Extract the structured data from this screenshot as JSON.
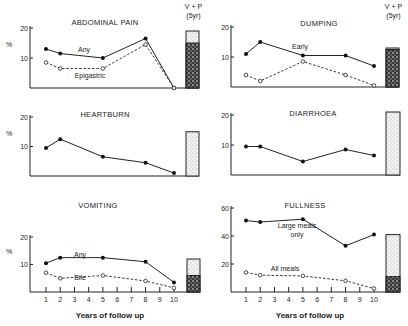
{
  "figure": {
    "bar_header_line1": "V + P",
    "bar_header_line2": "(5yr)",
    "xlabel": "Years of follow up",
    "ylabel": "%"
  },
  "chart_data": [
    {
      "id": "abdominal",
      "type": "line",
      "title": "ABDOMINAL PAIN",
      "ylabel": "%",
      "ylim": [
        0,
        20
      ],
      "yticks": [
        10,
        20
      ],
      "xlim": [
        1,
        10
      ],
      "x_ticks_shown": false,
      "show_bar_header": true,
      "series": [
        {
          "name": "Any",
          "style": "solid",
          "x": [
            1,
            2,
            5,
            8,
            10
          ],
          "values": [
            13,
            11.5,
            10,
            16.5,
            0
          ]
        },
        {
          "name": "Epigastric",
          "style": "dashed",
          "x": [
            1,
            2,
            5,
            8,
            10
          ],
          "values": [
            8.5,
            6.5,
            6.5,
            14.5,
            0
          ]
        }
      ],
      "comparison_bar": {
        "label": "V + P (5yr)",
        "total": 19,
        "dark_portion": 15
      }
    },
    {
      "id": "dumping",
      "type": "line",
      "title": "DUMPING",
      "ylabel": "",
      "ylim": [
        0,
        20
      ],
      "yticks": [
        10,
        20
      ],
      "xlim": [
        1,
        10
      ],
      "x_ticks_shown": false,
      "show_bar_header": true,
      "series": [
        {
          "name": "Early",
          "style": "solid",
          "x": [
            1,
            2,
            5,
            8,
            10
          ],
          "values": [
            11,
            15,
            10.5,
            10.5,
            7
          ]
        },
        {
          "name": "",
          "style": "dashed",
          "x": [
            1,
            2,
            5,
            8,
            10
          ],
          "values": [
            4,
            2,
            8.5,
            4,
            0.5
          ]
        }
      ],
      "comparison_bar": {
        "label": "V + P (5yr)",
        "total": 13,
        "dark_portion": 12.5
      }
    },
    {
      "id": "heartburn",
      "type": "line",
      "title": "HEARTBURN",
      "ylabel": "%",
      "ylim": [
        0,
        20
      ],
      "yticks": [
        10,
        20
      ],
      "xlim": [
        1,
        10
      ],
      "x_ticks_shown": false,
      "show_bar_header": false,
      "series": [
        {
          "name": "",
          "style": "solid",
          "x": [
            1,
            2,
            5,
            8,
            10
          ],
          "values": [
            9.5,
            12.5,
            6.5,
            4.5,
            1
          ]
        }
      ],
      "comparison_bar": {
        "label": "V + P (5yr)",
        "total": 15,
        "dark_portion": 0
      }
    },
    {
      "id": "diarrhoea",
      "type": "line",
      "title": "DIARRHOEA",
      "ylabel": "",
      "ylim": [
        0,
        20
      ],
      "yticks": [
        10,
        20
      ],
      "xlim": [
        1,
        10
      ],
      "x_ticks_shown": false,
      "show_bar_header": false,
      "series": [
        {
          "name": "",
          "style": "solid",
          "x": [
            1,
            2,
            5,
            8,
            10
          ],
          "values": [
            9.5,
            9.5,
            4.5,
            8.5,
            6.5
          ]
        }
      ],
      "comparison_bar": {
        "label": "V + P (5yr)",
        "total": 21,
        "dark_portion": 0
      }
    },
    {
      "id": "vomiting",
      "type": "line",
      "title": "VOMITING",
      "ylabel": "%",
      "ylim": [
        0,
        20
      ],
      "yticks": [
        10,
        20
      ],
      "xlim": [
        1,
        10
      ],
      "x_ticks_shown": true,
      "xticks": [
        "1",
        "2",
        "3",
        "4",
        "5",
        "6",
        "7",
        "8",
        "9",
        "10"
      ],
      "xlabel": "Years of follow up",
      "show_bar_header": false,
      "series": [
        {
          "name": "Any",
          "style": "solid",
          "x": [
            1,
            2,
            5,
            8,
            10
          ],
          "values": [
            10.5,
            12.5,
            12.5,
            11,
            3.5
          ]
        },
        {
          "name": "Bile",
          "style": "dashed",
          "x": [
            1,
            2,
            5,
            8,
            10
          ],
          "values": [
            7,
            5,
            6,
            4,
            1.5
          ]
        }
      ],
      "comparison_bar": {
        "label": "V + P (5yr)",
        "total": 12,
        "dark_portion": 6
      }
    },
    {
      "id": "fullness",
      "type": "line",
      "title": "FULLNESS",
      "ylabel": "",
      "ylim": [
        0,
        60
      ],
      "yticks": [
        20,
        40,
        60
      ],
      "xlim": [
        1,
        10
      ],
      "x_ticks_shown": true,
      "xticks": [
        "1",
        "2",
        "3",
        "4",
        "5",
        "6",
        "7",
        "8",
        "9",
        "10"
      ],
      "xlabel": "Years of follow up",
      "show_bar_header": false,
      "series": [
        {
          "name": "Large meals only",
          "style": "solid",
          "x": [
            1,
            2,
            5,
            8,
            10
          ],
          "values": [
            51,
            50,
            52,
            33,
            41
          ]
        },
        {
          "name": "All meals",
          "style": "dashed",
          "x": [
            1,
            2,
            5,
            8,
            10
          ],
          "values": [
            14,
            12,
            11.5,
            8,
            2.5
          ]
        }
      ],
      "comparison_bar": {
        "label": "V + P (5yr)",
        "total": 41,
        "dark_portion": 11
      }
    }
  ]
}
